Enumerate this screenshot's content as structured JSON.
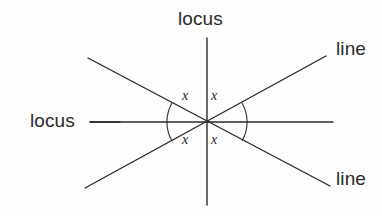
{
  "figure": {
    "background_color": "#fdfdfc",
    "stroke_color": "#2b2b2b",
    "text_color": "#2b2b2b",
    "center_point": {
      "x": 207,
      "y": 122
    },
    "lines": [
      {
        "name": "vertical-locus-line",
        "role": "locus",
        "x1": 207,
        "y1": 38,
        "x2": 207,
        "y2": 205
      },
      {
        "name": "horizontal-locus-line",
        "role": "locus",
        "x1": 90,
        "y1": 122,
        "x2": 333,
        "y2": 122
      },
      {
        "name": "diagonal-line-up-right",
        "role": "line",
        "x1": 88,
        "y1": 58,
        "x2": 326,
        "y2": 56
      },
      {
        "name": "diagonal-line-down-right",
        "role": "line",
        "x1": 85,
        "y1": 188,
        "x2": 330,
        "y2": 186
      }
    ],
    "labels": {
      "locus_top": "locus",
      "locus_left": "locus",
      "line_upper_right": "line",
      "line_lower_right": "line"
    },
    "angle_labels": {
      "top_left": "x",
      "top_right": "x",
      "bottom_left": "x",
      "bottom_right": "x"
    },
    "angle_arcs": [
      {
        "name": "left-angle-arc",
        "side": "left"
      },
      {
        "name": "right-angle-arc",
        "side": "right"
      }
    ]
  }
}
